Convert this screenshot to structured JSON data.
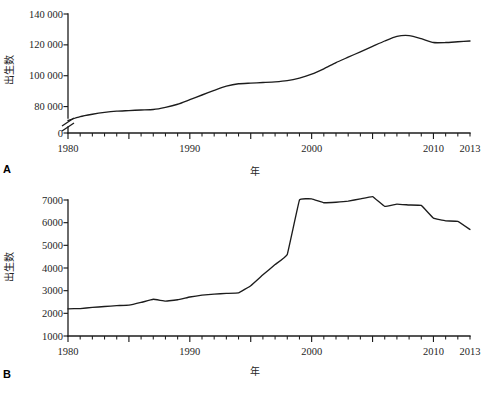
{
  "figure": {
    "panels": [
      {
        "letter": "A",
        "axis_x_label": "年",
        "axis_y_label": "出生数",
        "y_ticks": [
          "0",
          "80 000",
          "100 000",
          "120 000",
          "140 000"
        ],
        "x_ticks": [
          "1980",
          "1990",
          "2000",
          "2010",
          "2013"
        ]
      },
      {
        "letter": "B",
        "axis_x_label": "年",
        "axis_y_label": "出生数",
        "y_ticks": [
          "1000",
          "2000",
          "3000",
          "4000",
          "5000",
          "6000",
          "7000"
        ],
        "x_ticks": [
          "1980",
          "1990",
          "2000",
          "2010",
          "2013"
        ]
      }
    ]
  },
  "chart_data": [
    {
      "type": "line",
      "panel": "A",
      "title": "",
      "xlabel": "年",
      "ylabel": "出生数",
      "xlim": [
        1980,
        2013
      ],
      "ylim": [
        0,
        140000
      ],
      "y_axis_break": true,
      "y_axis_break_below": 70000,
      "grid": false,
      "legend": "none",
      "x_tick_labels": [
        "1980",
        "1990",
        "2000",
        "2010",
        "2013"
      ],
      "y_tick_labels": [
        "0",
        "80 000",
        "100 000",
        "120 000",
        "140 000"
      ],
      "y_tick_values": [
        0,
        80000,
        100000,
        120000,
        140000
      ],
      "x": [
        1980,
        1981,
        1982,
        1983,
        1984,
        1985,
        1986,
        1987,
        1988,
        1989,
        1990,
        1991,
        1992,
        1993,
        1994,
        1995,
        1996,
        1997,
        1998,
        1999,
        2000,
        2001,
        2002,
        2003,
        2004,
        2005,
        2006,
        2007,
        2008,
        2009,
        2010,
        2011,
        2012,
        2013
      ],
      "values": [
        71000,
        73500,
        75000,
        76200,
        77000,
        77400,
        77800,
        78100,
        79500,
        81500,
        84500,
        87500,
        90500,
        93200,
        94800,
        95200,
        95600,
        96000,
        96800,
        98500,
        101000,
        104500,
        108500,
        112000,
        115500,
        119000,
        122500,
        125500,
        126000,
        124000,
        121500,
        121500,
        122000,
        122500
      ]
    },
    {
      "type": "line",
      "panel": "B",
      "title": "",
      "xlabel": "年",
      "ylabel": "出生数",
      "xlim": [
        1980,
        2013
      ],
      "ylim": [
        1000,
        7000
      ],
      "y_axis_break": false,
      "grid": false,
      "legend": "none",
      "x_tick_labels": [
        "1980",
        "1990",
        "2000",
        "2010",
        "2013"
      ],
      "y_tick_labels": [
        "1000",
        "2000",
        "3000",
        "4000",
        "5000",
        "6000",
        "7000"
      ],
      "y_tick_values": [
        1000,
        2000,
        3000,
        4000,
        5000,
        6000,
        7000
      ],
      "x": [
        1980,
        1981,
        1982,
        1983,
        1984,
        1985,
        1986,
        1987,
        1988,
        1989,
        1990,
        1991,
        1992,
        1993,
        1994,
        1995,
        1996,
        1997,
        1998,
        1999,
        2000,
        2001,
        2002,
        2003,
        2004,
        2005,
        2006,
        2007,
        2008,
        2009,
        2010,
        2011,
        2012,
        2013
      ],
      "values": [
        2200,
        2210,
        2260,
        2300,
        2340,
        2360,
        2480,
        2620,
        2540,
        2600,
        2720,
        2800,
        2850,
        2880,
        2900,
        3220,
        3700,
        4150,
        4600,
        7000,
        7050,
        6880,
        6900,
        6950,
        7050,
        7150,
        6720,
        6820,
        6780,
        6760,
        6200,
        6080,
        6060,
        5700
      ]
    }
  ]
}
